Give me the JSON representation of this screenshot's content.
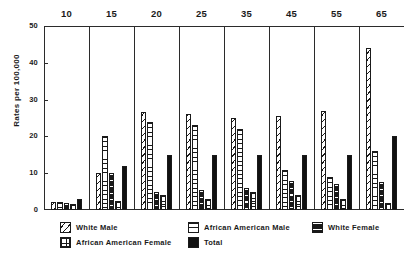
{
  "chart_data": {
    "type": "bar",
    "title": "",
    "xlabel": "",
    "ylabel": "Rates per 100,000",
    "ylim": [
      0,
      50
    ],
    "yticks": [
      0,
      10,
      20,
      30,
      40,
      50
    ],
    "grid": false,
    "legend_position": "bottom",
    "categories": [
      "10",
      "15",
      "20",
      "25",
      "35",
      "45",
      "55",
      "65"
    ],
    "series": [
      {
        "name": "White Male",
        "pattern": "diagonal-hatch",
        "values": [
          2.2,
          10.0,
          26.5,
          26.0,
          25.0,
          25.5,
          27.0,
          44.0
        ]
      },
      {
        "name": "African American Male",
        "pattern": "horizontal-lines",
        "values": [
          2.2,
          20.0,
          24.0,
          23.0,
          22.0,
          11.0,
          9.0,
          16.0
        ]
      },
      {
        "name": "White Female",
        "pattern": "dark-banded",
        "values": [
          1.8,
          10.0,
          5.0,
          5.5,
          6.0,
          8.0,
          7.0,
          7.5
        ]
      },
      {
        "name": "African American Female",
        "pattern": "stipple",
        "values": [
          1.6,
          2.5,
          4.0,
          3.0,
          5.0,
          4.0,
          3.0,
          2.0
        ]
      },
      {
        "name": "Total",
        "pattern": "solid-black",
        "values": [
          3.0,
          12.0,
          15.0,
          15.0,
          15.0,
          15.0,
          15.0,
          20.0
        ]
      }
    ]
  },
  "legend": {
    "entries": [
      {
        "label": "White Male",
        "pattern": "diagonal-hatch"
      },
      {
        "label": "African American Male",
        "pattern": "horizontal-lines"
      },
      {
        "label": "White Female",
        "pattern": "dark-banded"
      },
      {
        "label": "African American Female",
        "pattern": "stipple"
      },
      {
        "label": "Total",
        "pattern": "solid-black"
      }
    ]
  }
}
